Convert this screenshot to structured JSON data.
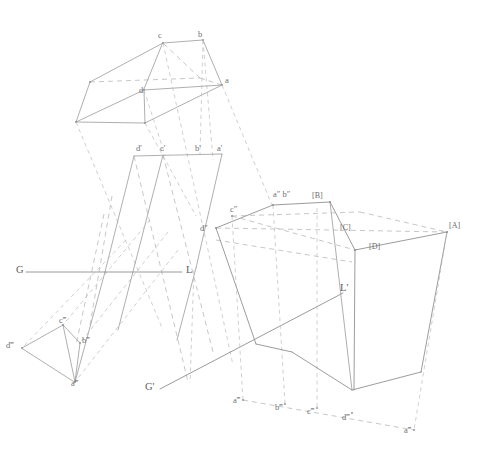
{
  "drawing": {
    "title": "Descriptive Geometry — Multi-view Projection of a Prism",
    "stroke_color_solid": "#9a9a9a",
    "stroke_color_dashed": "#b4b4b4",
    "label_color": "#6f6f6f",
    "background": "#ffffff",
    "width": 484,
    "height": 449
  },
  "ground_lines": [
    {
      "id": "gl-main",
      "left_label": "G",
      "right_label": "L",
      "x1": 18,
      "y1": 272,
      "x2": 185,
      "y2": 272
    },
    {
      "id": "gl-auxiliary",
      "left_label": "G'",
      "right_label": "L'",
      "x1": 160,
      "y1": 389,
      "x2": 345,
      "y2": 293
    }
  ],
  "labels": {
    "top_view": [
      {
        "name": "c",
        "text": "c",
        "x": 158,
        "y": 31
      },
      {
        "name": "b",
        "text": "b",
        "x": 198,
        "y": 30
      },
      {
        "name": "a",
        "text": "a",
        "x": 225,
        "y": 76
      },
      {
        "name": "d",
        "text": "d",
        "x": 139,
        "y": 86
      }
    ],
    "front_view": [
      {
        "name": "d-prime",
        "text": "d'",
        "x": 137,
        "y": 146
      },
      {
        "name": "c-prime",
        "text": "c'",
        "x": 161,
        "y": 146
      },
      {
        "name": "b-prime",
        "text": "b'",
        "x": 196,
        "y": 146
      },
      {
        "name": "a-prime",
        "text": "a'",
        "x": 218,
        "y": 146
      }
    ],
    "side_view": [
      {
        "name": "a-b-double-prime",
        "text": "a″ b″",
        "x": 275,
        "y": 192
      },
      {
        "name": "c-double-prime",
        "text": "c″",
        "x": 231,
        "y": 207
      },
      {
        "name": "d-double-prime",
        "text": "d″",
        "x": 201,
        "y": 226
      }
    ],
    "aux_left_view": [
      {
        "name": "d-triple-prime-left",
        "text": "d‴",
        "x": 8,
        "y": 343
      },
      {
        "name": "c-triple-prime-left",
        "text": "c‴",
        "x": 60,
        "y": 318
      },
      {
        "name": "b-triple-prime-left",
        "text": "b‴",
        "x": 82,
        "y": 338
      },
      {
        "name": "a-triple-prime-left",
        "text": "a‴",
        "x": 72,
        "y": 381
      }
    ],
    "aux_bottom_view": [
      {
        "name": "a-triple-prime-1",
        "text": "a‴",
        "x": 234,
        "y": 397
      },
      {
        "name": "b-triple-prime",
        "text": "b‴",
        "x": 276,
        "y": 404
      },
      {
        "name": "c-triple-prime",
        "text": "c‴",
        "x": 308,
        "y": 408
      },
      {
        "name": "d-triple-prime",
        "text": "d‴",
        "x": 343,
        "y": 414
      },
      {
        "name": "a-triple-prime-2",
        "text": "a‴",
        "x": 405,
        "y": 427
      }
    ],
    "bracket_vertices": [
      {
        "name": "vertex-A",
        "text": "[A]",
        "x": 447,
        "y": 224
      },
      {
        "name": "vertex-B",
        "text": "[B]",
        "x": 313,
        "y": 193
      },
      {
        "name": "vertex-C",
        "text": "[C]",
        "x": 341,
        "y": 225
      },
      {
        "name": "vertex-D",
        "text": "[D]",
        "x": 370,
        "y": 244
      }
    ],
    "ground_line_endpoints": [
      {
        "name": "ground-line-G",
        "text": "G",
        "x": 18,
        "y": 265
      },
      {
        "name": "ground-line-L",
        "text": "L",
        "x": 186,
        "y": 265
      },
      {
        "name": "ground-line-G-prime",
        "text": "G'",
        "x": 146,
        "y": 383
      },
      {
        "name": "ground-line-L-prime",
        "text": "L'",
        "x": 341,
        "y": 285
      }
    ]
  },
  "geometry": {
    "top_view_solid": [
      "M 163 43 L 203 40 L 222 85 L 144 90 Z",
      "M 163 43 L 90 82 L 76 122 L 145 123 L 222 85",
      "M 144 90 L 145 123",
      "M 163 43 L 144 90",
      "M 90 82 L 144 90"
    ],
    "top_view_dashed": [
      "M 90 82 L 200 78 L 163 43",
      "M 200 78 L 222 85"
    ],
    "front_view_solid": [
      "M 134 155 L 222 155 L 196 214 L 240 330 L 152 330 L 118 214 Z"
    ],
    "right_box_solid": [
      "M 273 205 L 330 202 L 355 250 L 447 232 L 421 372 L 354 390 L 305 368 L 216 228 Z"
    ],
    "notes": "Paths approximate the projected prism edges in each orthographic view."
  }
}
